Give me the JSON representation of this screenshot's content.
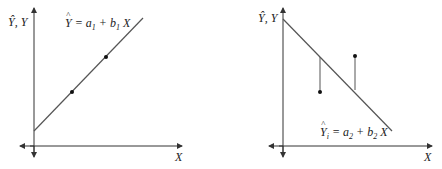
{
  "diagrams": [
    {
      "name": "positive-regression",
      "y_axis_label": "Ŷ, Y",
      "x_axis_label": "X",
      "equation": {
        "lhs": "Y",
        "lhs_hat": "^",
        "eq": " = a",
        "a_sub": "1",
        "plus": " + b",
        "b_sub": "1",
        "tail": " X"
      },
      "line": {
        "x1": 34,
        "y1": 131,
        "x2": 143,
        "y2": 18
      },
      "points": [
        {
          "x": 72,
          "y": 92
        },
        {
          "x": 106,
          "y": 57
        }
      ],
      "residuals": []
    },
    {
      "name": "negative-regression-with-residuals",
      "y_axis_label": "Ŷ, Y",
      "x_axis_label": "X",
      "equation": {
        "lhs": "Y",
        "lhs_hat": "^",
        "lhs_sub": "i",
        "eq": " = a",
        "a_sub": "2",
        "plus": " + b",
        "b_sub": "2",
        "tail": " X"
      },
      "line": {
        "x1": 283,
        "y1": 19,
        "x2": 392,
        "y2": 131
      },
      "points": [
        {
          "x": 320,
          "y": 92
        },
        {
          "x": 355,
          "y": 56
        }
      ],
      "residuals": [
        {
          "x": 320,
          "y1": 57,
          "y2": 92
        },
        {
          "x": 355,
          "y1": 56,
          "y2": 90
        }
      ]
    }
  ],
  "colors": {
    "axis": "#333333",
    "line": "#555555",
    "point": "#111111"
  }
}
